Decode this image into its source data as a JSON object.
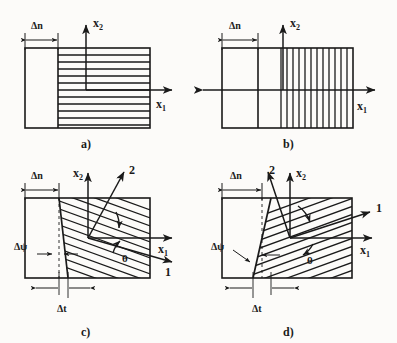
{
  "figure": {
    "caption_type": "four-panel technical line diagram",
    "background_color": "#fcfbf9",
    "line_color": "#1a1a1a"
  },
  "panels": [
    {
      "id": "a",
      "label": "a)",
      "hatch_orientation": "horizontal",
      "hatch_count": 11,
      "hatch_angle_deg": 0,
      "left_block_filled": false,
      "axes": [
        {
          "name": "x2",
          "base": "x",
          "subscript": "2",
          "direction": "up"
        },
        {
          "name": "x1",
          "base": "x",
          "subscript": "1",
          "direction": "right"
        }
      ],
      "dimensions": [
        {
          "name": "delta-n",
          "label": "Δn"
        }
      ],
      "x1_left_arrow": false
    },
    {
      "id": "b",
      "label": "b)",
      "hatch_orientation": "vertical",
      "hatch_count": 15,
      "hatch_angle_deg": 90,
      "left_block_filled": false,
      "axes": [
        {
          "name": "x2",
          "base": "x",
          "subscript": "2",
          "direction": "up"
        },
        {
          "name": "x1",
          "base": "x",
          "subscript": "1",
          "direction": "right"
        }
      ],
      "dimensions": [
        {
          "name": "delta-n",
          "label": "Δn"
        }
      ],
      "x1_left_arrow": true
    },
    {
      "id": "c",
      "label": "c)",
      "hatch_orientation": "oblique-descending",
      "hatch_count": 12,
      "hatch_angle_deg": -20,
      "left_block_filled": false,
      "axes": [
        {
          "name": "x2",
          "base": "x",
          "subscript": "2",
          "direction": "up"
        },
        {
          "name": "x1",
          "base": "x",
          "subscript": "1",
          "direction": "right"
        },
        {
          "name": "axis-2",
          "base": "2",
          "subscript": "",
          "direction": "up-right"
        },
        {
          "name": "axis-1",
          "base": "1",
          "subscript": "",
          "direction": "down-right"
        }
      ],
      "dimensions": [
        {
          "name": "delta-n",
          "label": "Δn"
        },
        {
          "name": "delta-psi",
          "label": "Δψ"
        },
        {
          "name": "delta-t",
          "label": "Δt"
        }
      ],
      "angle": {
        "name": "theta",
        "label": "θ"
      },
      "x1_left_arrow": false
    },
    {
      "id": "d",
      "label": "d)",
      "hatch_orientation": "oblique-ascending",
      "hatch_count": 12,
      "hatch_angle_deg": 20,
      "left_block_filled": false,
      "axes": [
        {
          "name": "x2",
          "base": "x",
          "subscript": "2",
          "direction": "up"
        },
        {
          "name": "x1",
          "base": "x",
          "subscript": "1",
          "direction": "right"
        },
        {
          "name": "axis-2",
          "base": "2",
          "subscript": "",
          "direction": "up-left"
        },
        {
          "name": "axis-1",
          "base": "1",
          "subscript": "",
          "direction": "up-right"
        }
      ],
      "dimensions": [
        {
          "name": "delta-n",
          "label": "Δn"
        },
        {
          "name": "delta-psi",
          "label": "Δψ"
        },
        {
          "name": "delta-t",
          "label": "Δt"
        }
      ],
      "angle": {
        "name": "theta",
        "label": "θ"
      },
      "x1_left_arrow": false
    }
  ],
  "symbols": {
    "delta_n": "Δn",
    "delta_t": "Δt",
    "delta_psi": "Δψ",
    "theta": "θ",
    "x_base": "x",
    "sub_1": "1",
    "sub_2": "2",
    "axis_1": "1",
    "axis_2": "2",
    "label_a": "a)",
    "label_b": "b)",
    "label_c": "c)",
    "label_d": "d)"
  }
}
